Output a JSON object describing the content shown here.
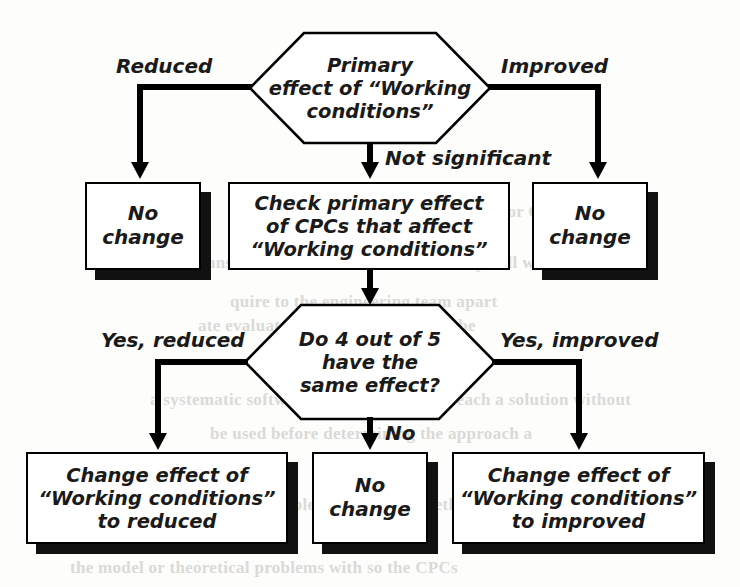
{
  "diagram": {
    "style": {
      "line_color": "#000000",
      "box_fill": "#ffffff",
      "shadow_color": "#111111",
      "text_color": "#1a1a1a"
    }
  },
  "nodes": {
    "top_decision": {
      "id": "top-decision",
      "shape": "hexagon",
      "text": "Primary\neffect of “Working\nconditions”"
    },
    "no_change_left": {
      "id": "no-change-left",
      "shape": "box",
      "text": "No\nchange"
    },
    "check_cpcs": {
      "id": "check-cpcs",
      "shape": "box",
      "text": "Check primary effect\nof CPCs that affect\n“Working conditions”"
    },
    "no_change_right": {
      "id": "no-change-right",
      "shape": "box",
      "text": "No\nchange"
    },
    "second_decision": {
      "id": "second-decision",
      "shape": "hexagon",
      "text": "Do 4 out of 5\nhave the\nsame effect?"
    },
    "change_reduced": {
      "id": "change-to-reduced",
      "shape": "box",
      "text": "Change effect of\n“Working conditions”\nto reduced"
    },
    "no_change_bottom": {
      "id": "no-change-bottom",
      "shape": "box",
      "text": "No\nchange"
    },
    "change_improved": {
      "id": "change-to-improved",
      "shape": "box",
      "text": "Change effect of\n“Working conditions”\nto improved"
    }
  },
  "edge_labels": {
    "reduced": "Reduced",
    "improved": "Improved",
    "not_significant": "Not significant",
    "yes_reduced": "Yes, reduced",
    "yes_improved": "Yes, improved",
    "no": "No"
  },
  "background_text": {
    "line1": "quire to the engineering team apart",
    "line2": "ate evaluated and some parts may be",
    "line3": "rocedure for CPCs",
    "line4": "A  the main answer is to elaborate excursion may still with",
    "line5": "a systematic software. I can estimate to reach a solution without",
    "line6": "be used before determining the approach a",
    "line7": "a  level of theoretical problems facing the method",
    "line8": "the model or theoretical problems with so the CPCs"
  }
}
